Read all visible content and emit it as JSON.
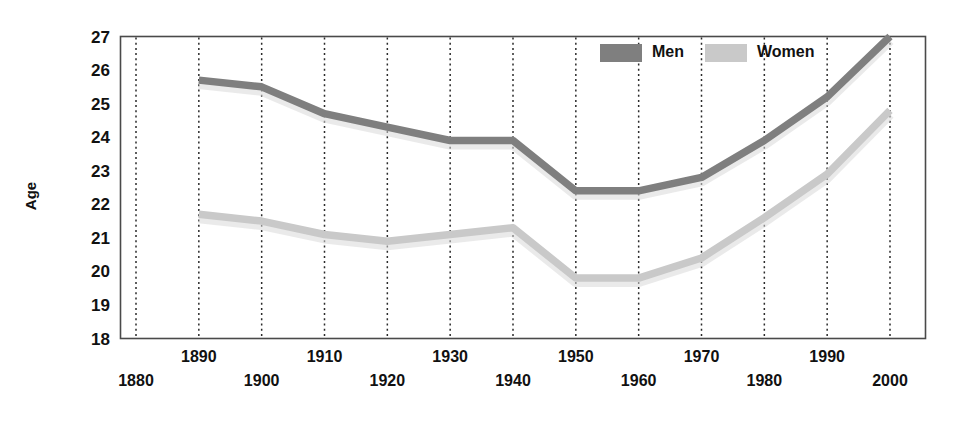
{
  "chart_data": {
    "type": "line",
    "title": "",
    "xlabel": "",
    "ylabel": "Age",
    "ylim": [
      18,
      27
    ],
    "xlim": [
      1880,
      2000
    ],
    "grid": true,
    "grid_orientation": "vertical-dotted",
    "legend_position": "top-right-inside",
    "x": [
      1880,
      1890,
      1900,
      1910,
      1920,
      1930,
      1940,
      1950,
      1960,
      1970,
      1980,
      1990,
      2000
    ],
    "categories": [
      "1880",
      "1890",
      "1900",
      "1910",
      "1920",
      "1930",
      "1940",
      "1950",
      "1960",
      "1970",
      "1980",
      "1990",
      "2000"
    ],
    "yticks": [
      18,
      19,
      20,
      21,
      22,
      23,
      24,
      25,
      26,
      27
    ],
    "series": [
      {
        "name": "Men",
        "color": "#7f7f7f",
        "values": [
          null,
          25.7,
          25.5,
          24.7,
          24.3,
          23.9,
          23.9,
          22.4,
          22.4,
          22.8,
          23.9,
          25.2,
          27.0
        ]
      },
      {
        "name": "Women",
        "color": "#c9c9c9",
        "values": [
          null,
          21.7,
          21.5,
          21.1,
          20.9,
          21.1,
          21.3,
          19.8,
          19.8,
          20.4,
          21.6,
          22.9,
          24.8
        ]
      }
    ]
  },
  "axes": {
    "y_title": "Age",
    "y_ticks": [
      "27",
      "26",
      "25",
      "24",
      "23",
      "22",
      "21",
      "20",
      "19",
      "18"
    ],
    "x_ticks_upper_row": [
      "1890",
      "1910",
      "1930",
      "1950",
      "1970",
      "1990"
    ],
    "x_ticks_lower_row": [
      "1880",
      "1900",
      "1920",
      "1940",
      "1960",
      "1980",
      "2000"
    ]
  },
  "legend": {
    "items": [
      {
        "label": "Men",
        "color": "#7f7f7f"
      },
      {
        "label": "Women",
        "color": "#c9c9c9"
      }
    ]
  },
  "colors": {
    "men": "#7f7f7f",
    "women": "#c9c9c9",
    "axis": "#4a4a4a",
    "grid": "#2b2b2b",
    "text": "#111111",
    "background": "#ffffff"
  }
}
